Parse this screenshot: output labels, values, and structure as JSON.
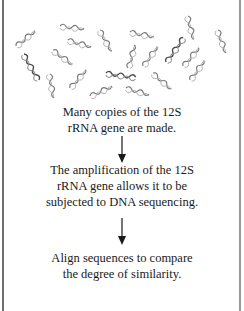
{
  "diagram": {
    "illustration": "many-copies-of-dna-helix-fragments",
    "steps": [
      {
        "lines": [
          "Many copies of the 12S",
          "rRNA gene are made."
        ]
      },
      {
        "lines": [
          "The amplification of the 12S",
          "rRNA gene allows it to be",
          "subjected to DNA sequencing."
        ]
      },
      {
        "lines": [
          "Align sequences to compare",
          "the degree of similarity."
        ]
      }
    ],
    "arrows": [
      "down-arrow",
      "down-arrow"
    ],
    "colors": {
      "text": "#1a1a1a",
      "helix_dark": "#555555",
      "helix_light": "#9a9a9a",
      "border": "#6f6f6f"
    }
  }
}
